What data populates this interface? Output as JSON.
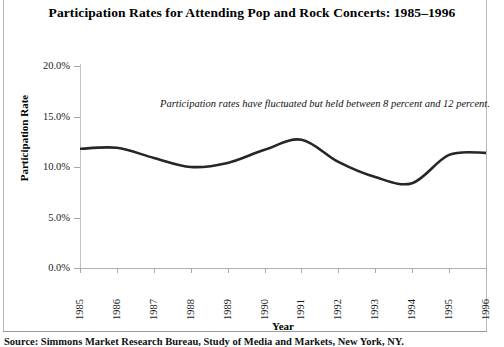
{
  "title": "Participation Rates for Attending Pop and Rock Concerts: 1985–1996",
  "annotation": "Participation rates have fluctuated but held between 8 percent and 12 percent.",
  "source_note": "Source: Simmons Market Research Bureau, Study of Media and Markets, New York, NY.",
  "axis": {
    "x_title": "Year",
    "y_title": "Participation Rate"
  },
  "chart_data": {
    "type": "line",
    "title": "Participation Rates for Attending Pop and Rock Concerts: 1985–1996",
    "xlabel": "Year",
    "ylabel": "Participation Rate",
    "categories": [
      "1985",
      "1986",
      "1987",
      "1988",
      "1989",
      "1990",
      "1991",
      "1992",
      "1993",
      "1994",
      "1995",
      "1996"
    ],
    "values": [
      11.8,
      11.9,
      10.9,
      10.0,
      10.4,
      11.7,
      12.7,
      10.5,
      9.0,
      8.4,
      11.2,
      11.4
    ],
    "series": [
      {
        "name": "Participation Rate",
        "values": [
          11.8,
          11.9,
          10.9,
          10.0,
          10.4,
          11.7,
          12.7,
          10.5,
          9.0,
          8.4,
          11.2,
          11.4
        ]
      }
    ],
    "ylim": [
      0,
      20
    ],
    "ytick_labels": [
      "0.0%",
      "5.0%",
      "10.0%",
      "15.0%",
      "20.0%"
    ],
    "ytick_values": [
      0,
      5,
      10,
      15,
      20
    ],
    "xlim": [
      "1985",
      "1996"
    ],
    "grid": false,
    "legend": false,
    "line_color": "#262626",
    "annotation_text": "Participation rates have fluctuated but held between 8 percent and 12 percent.",
    "smoothing": "spline"
  },
  "ticks": {
    "y": [
      {
        "label": "20.0%",
        "value": 20
      },
      {
        "label": "15.0%",
        "value": 15
      },
      {
        "label": "10.0%",
        "value": 10
      },
      {
        "label": "5.0%",
        "value": 5
      },
      {
        "label": "0.0%",
        "value": 0
      }
    ],
    "x": [
      {
        "label": "1985"
      },
      {
        "label": "1986"
      },
      {
        "label": "1987"
      },
      {
        "label": "1988"
      },
      {
        "label": "1989"
      },
      {
        "label": "1990"
      },
      {
        "label": "1991"
      },
      {
        "label": "1992"
      },
      {
        "label": "1993"
      },
      {
        "label": "1994"
      },
      {
        "label": "1995"
      },
      {
        "label": "1996"
      }
    ]
  }
}
